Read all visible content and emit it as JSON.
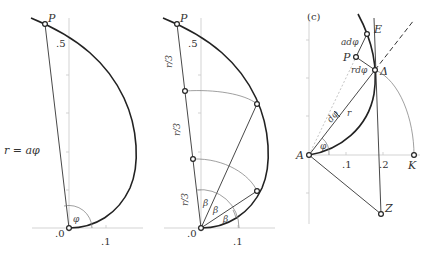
{
  "panels": [
    {
      "id": "a",
      "labels": {
        "point_P": "P",
        "y_tick": ".5",
        "origin": ".0",
        "x_tick": ".1",
        "radius_eq": "r = aφ",
        "angle": "φ"
      }
    },
    {
      "id": "b",
      "labels": {
        "point_P": "P",
        "y_tick": ".5",
        "origin": ".0",
        "x_tick": ".1",
        "segment": "r/3",
        "angle": "β"
      }
    },
    {
      "id": "c",
      "labels": {
        "panel_tag": "(c)",
        "point_E": "E",
        "point_P": "P",
        "point_delta": "Δ",
        "point_A": "A",
        "point_K": "K",
        "point_Z": "Z",
        "ad_phi": "adφ",
        "rd_phi": "rdφ",
        "d_phi": "dφ",
        "r": "r",
        "angle": "φ",
        "x_tick_1": ".1",
        "x_tick_2": ".2"
      }
    }
  ]
}
